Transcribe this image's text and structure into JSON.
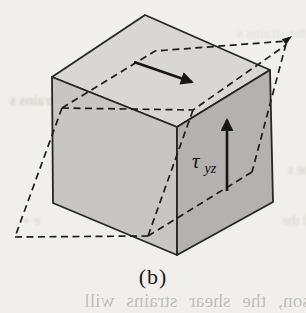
{
  "figure": {
    "caption": "(b)",
    "stress_label": {
      "symbol": "τ",
      "subscript": "yz"
    },
    "colors": {
      "background": "#f1efeb",
      "face_top": "#d8d7d3",
      "face_left": "#c7c6c2",
      "face_right": "#b3b2ae",
      "line": "#1e1e1e"
    },
    "bleed_text": {
      "top_right": "the strains s",
      "left_mid": "strains s",
      "right_mid": "he s",
      "right_low": "d the",
      "left_low": "e +",
      "bottom": "son, the shear strains will"
    }
  }
}
